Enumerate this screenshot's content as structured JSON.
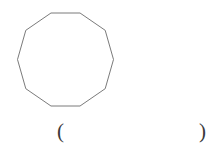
{
  "page": {
    "background_color": "#ffffff",
    "width": 220,
    "height": 151
  },
  "figure": {
    "name": "regular-decagon",
    "shape_type": "regular polygon",
    "sides": 10,
    "stroke_color": "#6b6b6b",
    "stroke_width": 0.9,
    "fill": "none",
    "center_x": 65.5,
    "center_y": 59.5,
    "circumradius": 47,
    "rotation_deg": 18,
    "points": "50.98,13.00 80.02,13.00 105.20,30.30 113.50,59.50 105.20,88.70 80.02,106.00 50.98,106.00 25.80,88.70 17.50,59.50 25.80,30.30"
  },
  "answer": {
    "open_paren": "(",
    "close_paren": ")",
    "value": "",
    "placeholder": ""
  }
}
